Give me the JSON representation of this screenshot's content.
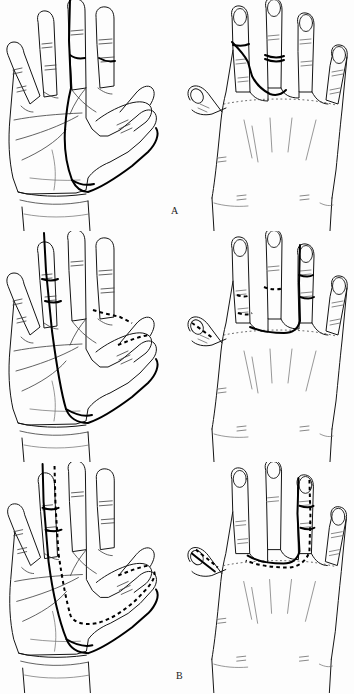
{
  "figure": {
    "type": "anatomical-line-drawing",
    "background_color": "#fdfdfd",
    "ink_color": "#141414",
    "marking_color": "#000000",
    "panels": [
      {
        "label": "A",
        "views": [
          {
            "name": "palmar-view",
            "side": "left",
            "marking_style": "solid"
          },
          {
            "name": "dorsal-view",
            "side": "right",
            "marking_style": "solid"
          }
        ]
      },
      {
        "label": "B",
        "views": [
          {
            "name": "palmar-view",
            "side": "left",
            "marking_style": "solid-and-dashed"
          },
          {
            "name": "dorsal-view",
            "side": "right",
            "marking_style": "solid-and-dashed"
          }
        ]
      },
      {
        "label": "C",
        "views": [
          {
            "name": "palmar-view",
            "side": "left",
            "marking_style": "solid-and-dashed"
          },
          {
            "name": "dorsal-view",
            "side": "right",
            "marking_style": "solid-and-dashed"
          }
        ]
      }
    ]
  },
  "labels": {
    "a": "A",
    "b": "B",
    "c": "C"
  }
}
